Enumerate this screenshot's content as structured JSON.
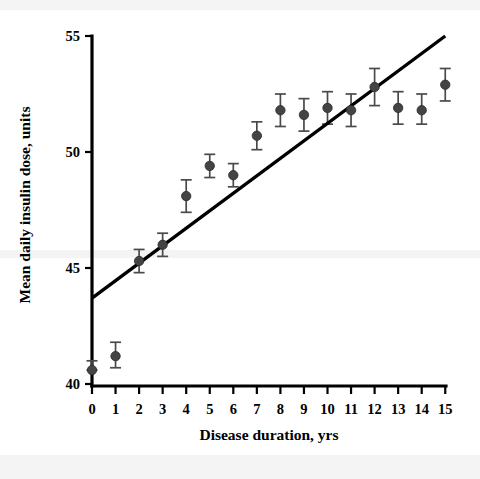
{
  "chart_data": {
    "type": "scatter",
    "title": "",
    "subtitle": "",
    "xlabel": "Disease duration, yrs",
    "ylabel": "Mean daily insulin dose, units",
    "xlim": [
      -0.45,
      15.6
    ],
    "ylim": [
      40,
      55
    ],
    "xticks": [
      0,
      1,
      2,
      3,
      4,
      5,
      6,
      7,
      8,
      9,
      10,
      11,
      12,
      13,
      14,
      15
    ],
    "xtick_labels": [
      "0",
      "1",
      "2",
      "3",
      "4",
      "5",
      "6",
      "7",
      "8",
      "9",
      "10",
      "11",
      "12",
      "13",
      "14",
      "15"
    ],
    "yticks": [
      40,
      45,
      50,
      55
    ],
    "ytick_labels": [
      "40",
      "45",
      "50",
      "55"
    ],
    "grid": false,
    "legend": "none",
    "marker_style": "filled-circle-with-error-bars",
    "x": [
      0,
      1,
      2,
      3,
      4,
      5,
      6,
      7,
      8,
      9,
      10,
      11,
      12,
      13,
      14,
      15
    ],
    "values": [
      40.6,
      41.2,
      45.3,
      46.0,
      48.1,
      49.4,
      49.0,
      50.7,
      51.8,
      51.6,
      51.9,
      51.8,
      52.8,
      51.9,
      51.8,
      52.9
    ],
    "error_low": [
      40.6,
      40.7,
      44.8,
      45.5,
      47.4,
      48.9,
      48.5,
      50.1,
      51.1,
      50.9,
      51.2,
      51.1,
      52.0,
      51.2,
      51.2,
      52.2
    ],
    "error_high": [
      41.0,
      41.8,
      45.8,
      46.5,
      48.8,
      49.9,
      49.5,
      51.3,
      52.5,
      52.3,
      52.6,
      52.5,
      53.6,
      52.6,
      52.5,
      53.6
    ],
    "series": [
      {
        "name": "Mean daily insulin dose",
        "type": "scatter",
        "values": [
          40.6,
          41.2,
          45.3,
          46.0,
          48.1,
          49.4,
          49.0,
          50.7,
          51.8,
          51.6,
          51.9,
          51.8,
          52.8,
          51.9,
          51.8,
          52.9
        ]
      },
      {
        "name": "Regression line",
        "type": "line",
        "x": [
          0,
          15
        ],
        "values": [
          43.7,
          55.0
        ]
      }
    ],
    "annotations": []
  }
}
